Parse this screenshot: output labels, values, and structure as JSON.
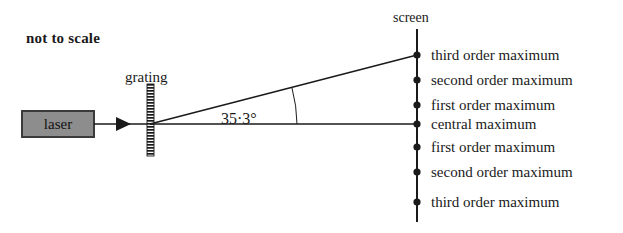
{
  "diagram": {
    "title_note": "not to scale",
    "background_color": "#ffffff",
    "line_color": "#1a1a1a",
    "source_label": "laser",
    "source_fill_color": "#8d8d8d",
    "source_border_color": "#3a3a3a",
    "grating_label": "grating",
    "screen_label": "screen",
    "angle_label": "35·3°",
    "maxima": [
      {
        "label": "third order maximum",
        "y": 55
      },
      {
        "label": "second order maximum",
        "y": 80
      },
      {
        "label": "first order maximum",
        "y": 105
      },
      {
        "label": "central maximum",
        "y": 124
      },
      {
        "label": "first order maximum",
        "y": 147
      },
      {
        "label": "second order maximum",
        "y": 172
      },
      {
        "label": "third order maximum",
        "y": 202
      }
    ]
  }
}
